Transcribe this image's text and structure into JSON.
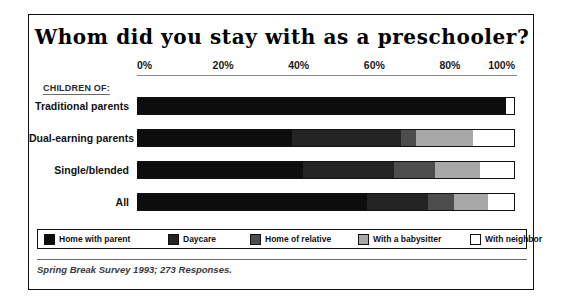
{
  "figure": {
    "title": "Whom did you stay with as a preschooler?",
    "group_caption": "CHILDREN OF:",
    "footnote": "Spring Break Survey 1993; 273 Responses."
  },
  "chart_data": {
    "type": "bar",
    "orientation": "horizontal",
    "stacked": true,
    "stack_mode": "percent",
    "title": "Whom did you stay with as a preschooler?",
    "xlabel": "",
    "ylabel": "CHILDREN OF:",
    "xlim": [
      0,
      100
    ],
    "xticks": [
      0,
      20,
      40,
      60,
      80,
      100
    ],
    "xticklabels": [
      "0%",
      "20%",
      "40%",
      "60%",
      "80%",
      "100%"
    ],
    "grid": false,
    "legend_position": "bottom",
    "categories": [
      "Traditional parents",
      "Dual-earning parents",
      "Single/blended",
      "All"
    ],
    "series": [
      {
        "name": "Home with parent",
        "color": "#0d0d0d",
        "values": [
          98,
          41,
          44,
          61
        ]
      },
      {
        "name": "Daycare",
        "color": "#242424",
        "values": [
          0,
          29,
          24,
          16
        ]
      },
      {
        "name": "Home of relative",
        "color": "#4d4d4d",
        "values": [
          0,
          4,
          11,
          7
        ]
      },
      {
        "name": "With a babysitter",
        "color": "#a8a8a8",
        "values": [
          0,
          15,
          12,
          9
        ]
      },
      {
        "name": "With neighbor",
        "color": "#ffffff",
        "values": [
          2,
          11,
          9,
          7
        ]
      }
    ],
    "annotation": "Spring Break Survey 1993; 273 Responses."
  }
}
